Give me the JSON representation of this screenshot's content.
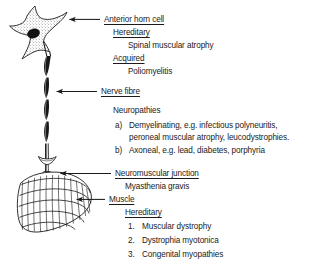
{
  "figure": {
    "ink_color": "#1a1a1a",
    "background_color": "#ffffff"
  },
  "labels": {
    "anterior_horn_cell": "Anterior horn cell",
    "nerve_fibre": "Nerve fibre",
    "neuromuscular_junction": "Neuromuscular junction",
    "muscle": "Muscle"
  },
  "headings": {
    "hereditary_1": "Hereditary",
    "acquired": "Acquired",
    "neuropathies": "Neuropathies",
    "hereditary_2": "Hereditary"
  },
  "entries": {
    "spinal_muscular_atrophy": "Spinal muscular atrophy",
    "poliomyelitis": "Poliomyelitis",
    "myasthenia_gravis": "Myasthenia gravis"
  },
  "neuropathy_items": [
    {
      "marker": "a)",
      "line1": "Demyelinating, e.g. infectious polyneuritis,",
      "line2": "peroneal muscular atrophy, leucodystrophies."
    },
    {
      "marker": "b)",
      "line1": "Axoneal, e.g. lead, diabetes, porphyria",
      "line2": ""
    }
  ],
  "muscle_items": [
    {
      "marker": "1.",
      "text": "Muscular dystrophy"
    },
    {
      "marker": "2.",
      "text": "Dystrophia myotonica"
    },
    {
      "marker": "3.",
      "text": "Congenital myopathies"
    }
  ],
  "icons": {
    "neuron": "anterior-horn-cell-icon",
    "axon": "myelinated-nerve-fibre-icon",
    "junction": "neuromuscular-junction-icon",
    "muscle": "striated-muscle-icon",
    "arrow": "leader-arrow-icon"
  }
}
